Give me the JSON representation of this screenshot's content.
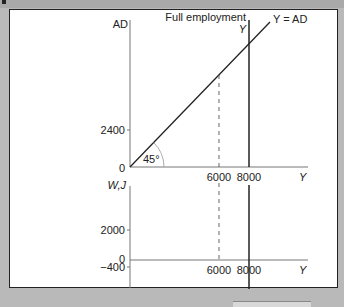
{
  "figure": {
    "top_panel": {
      "y_axis_label": "AD",
      "x_axis_label": "Y",
      "origin_label": "0",
      "y_ticks": [
        {
          "label": "2400",
          "value": 2400
        }
      ],
      "x_ticks": [
        {
          "label": "6000",
          "value": 6000
        },
        {
          "label": "8000",
          "value": 8000
        }
      ],
      "angle_label": "45°",
      "line_label": "Y = AD",
      "full_employment_label": "Full employment",
      "full_employment_sub": "Y"
    },
    "bottom_panel": {
      "y_axis_label": "W,J",
      "x_axis_label": "Y",
      "y_ticks": [
        {
          "label": "2000",
          "value": 2000
        },
        {
          "label": "0",
          "value": 0
        },
        {
          "label": "−400",
          "value": -400
        }
      ],
      "x_ticks": [
        {
          "label": "6000",
          "value": 6000
        },
        {
          "label": "8000",
          "value": 8000
        }
      ]
    }
  },
  "colors": {
    "background": "#b9b9b9",
    "panel": "#ffffff",
    "ink": "#222222",
    "axis": "#777777"
  }
}
